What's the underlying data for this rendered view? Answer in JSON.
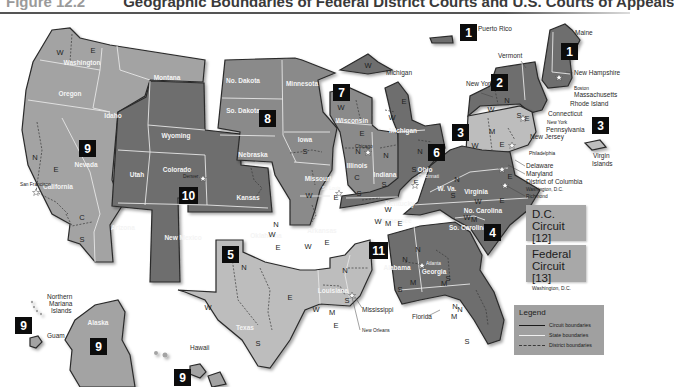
{
  "figure": {
    "number_label": "Figure 12.2",
    "title": "Geographic Boundaries of Federal District Courts and U.S. Courts of Appeals"
  },
  "circuits": [
    {
      "number": "1",
      "states": [
        "Maine",
        "New Hampshire",
        "Massachusetts",
        "Rhode Island",
        "Puerto Rico"
      ],
      "seat": "Boston"
    },
    {
      "number": "2",
      "states": [
        "Vermont",
        "New York",
        "Connecticut"
      ],
      "seat": "New York"
    },
    {
      "number": "3",
      "states": [
        "Pennsylvania",
        "New Jersey",
        "Delaware",
        "Virgin Islands"
      ],
      "seat": "Philadelphia"
    },
    {
      "number": "4",
      "states": [
        "Maryland",
        "W. Va.",
        "Virginia",
        "No. Carolina",
        "So. Carolina"
      ],
      "seat": "Richmond"
    },
    {
      "number": "5",
      "states": [
        "Texas",
        "Louisiana",
        "Mississippi"
      ],
      "seat": "New Orleans"
    },
    {
      "number": "6",
      "states": [
        "Michigan",
        "Ohio",
        "Kentucky",
        "Tennessee"
      ],
      "seat": "Cincinnati"
    },
    {
      "number": "7",
      "states": [
        "Wisconsin",
        "Illinois",
        "Indiana"
      ],
      "seat": "Chicago"
    },
    {
      "number": "8",
      "states": [
        "No. Dakota",
        "So. Dakota",
        "Nebraska",
        "Minnesota",
        "Iowa",
        "Missouri",
        "Arkansas"
      ],
      "seat": "St. Louis"
    },
    {
      "number": "9",
      "states": [
        "Washington",
        "Oregon",
        "Idaho",
        "Montana",
        "Nevada",
        "California",
        "Arizona",
        "Alaska",
        "Hawaii",
        "Guam",
        "Northern Mariana Islands"
      ],
      "seat": "San Francisco"
    },
    {
      "number": "10",
      "states": [
        "Wyoming",
        "Utah",
        "Colorado",
        "Kansas",
        "New Mexico",
        "Oklahoma"
      ],
      "seat": "Denver"
    },
    {
      "number": "11",
      "states": [
        "Alabama",
        "Georgia",
        "Florida"
      ],
      "seat": "Atlanta"
    }
  ],
  "state_labels": {
    "washington": "Washington",
    "oregon": "Oregon",
    "idaho": "Idaho",
    "montana": "Montana",
    "nevada": "Nevada",
    "california": "California",
    "arizona": "Arizona",
    "utah": "Utah",
    "wyoming": "Wyoming",
    "colorado": "Colorado",
    "new_mexico": "New Mexico",
    "kansas": "Kansas",
    "oklahoma": "Oklahoma",
    "texas": "Texas",
    "no_dakota": "No. Dakota",
    "so_dakota": "So. Dakota",
    "nebraska": "Nebraska",
    "minnesota": "Minnesota",
    "iowa": "Iowa",
    "missouri": "Missouri",
    "arkansas": "Arkansas",
    "louisiana": "Louisiana",
    "wisconsin": "Wisconsin",
    "illinois": "Illinois",
    "indiana": "Indiana",
    "michigan": "Michigan",
    "ohio": "Ohio",
    "kentucky": "Kentucky",
    "tennessee": "Tennessee",
    "alabama": "Alabama",
    "georgia": "Georgia",
    "w_va": "W. Va.",
    "virginia": "Virginia",
    "no_carolina": "No. Carolina",
    "so_carolina": "So. Carolina",
    "alaska": "Alaska"
  },
  "external_labels": {
    "puerto_rico": "Puerto Rico",
    "maine": "Maine",
    "vermont": "Vermont",
    "new_york": "New York",
    "new_hampshire": "New Hampshire",
    "boston": "Boston",
    "massachusetts": "Massachusetts",
    "rhode_island": "Rhode Island",
    "connecticut": "Connecticut",
    "new_york_city": "New York",
    "pennsylvania": "Pennsylvania",
    "new_jersey": "New Jersey",
    "philadelphia": "Philadelphia",
    "delaware": "Delaware",
    "maryland": "Maryland",
    "district_of_columbia": "District of Columbia",
    "washington_dc": "Washington, D.C.",
    "richmond": "Richmond",
    "virgin_islands": "Virgin Islands",
    "michigan_up": "Michigan",
    "mississippi": "Mississippi",
    "new_orleans": "New Orleans",
    "florida": "Florida",
    "northern_mariana": "Northern Mariana Islands",
    "guam": "Guam",
    "hawaii": "Hawaii",
    "san_francisco": "San Francisco",
    "denver": "Denver",
    "st_louis": "St. Louis",
    "chicago": "Chicago",
    "atlanta": "Atlanta",
    "cincinnati": "Cincinnati"
  },
  "district_letters": [
    "N",
    "S",
    "E",
    "W",
    "C",
    "M"
  ],
  "dc_circuit": {
    "name": "D.C. Circuit [12]",
    "location": "Washington, D.C."
  },
  "federal_circuit": {
    "name": "Federal Circuit [13]",
    "location": "Washington, D.C."
  },
  "legend": {
    "title": "Legend",
    "items": [
      {
        "label": "Circuit boundaries",
        "style": "solid-dark"
      },
      {
        "label": "State boundaries",
        "style": "solid-white"
      },
      {
        "label": "District boundaries",
        "style": "dashed"
      }
    ]
  },
  "colors": {
    "circuit_dark": "#6e6e6e",
    "circuit_mid": "#8a8a8a",
    "circuit_light": "#a3a3a3",
    "circuit_pale": "#bdbdbd",
    "badge": "#0c0c0c",
    "panel": "#a8a8a8"
  }
}
